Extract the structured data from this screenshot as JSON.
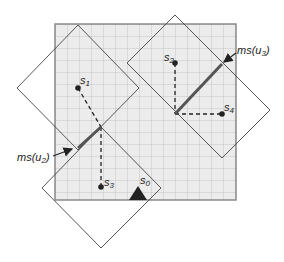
{
  "diagram": {
    "grid": {
      "x": 55,
      "y": 24,
      "width": 181,
      "height": 176,
      "cell": 12,
      "fill": "#ececec",
      "line": "#bdbdbd",
      "border": "#8a8a8a"
    },
    "points": [
      {
        "id": "s1",
        "label": "s",
        "sub": "1",
        "x": 78,
        "y": 88
      },
      {
        "id": "s2",
        "label": "s",
        "sub": "2",
        "x": 175,
        "y": 63
      },
      {
        "id": "s3",
        "label": "s",
        "sub": "3",
        "x": 101,
        "y": 187
      },
      {
        "id": "s4",
        "label": "s",
        "sub": "4",
        "x": 222,
        "y": 114
      }
    ],
    "robot": {
      "id": "s0",
      "label": "s",
      "sub": "0",
      "x": 138,
      "y": 200,
      "color": "#222222"
    },
    "labels": {
      "ms_u3": {
        "prefix": "ms(u",
        "sub": "3",
        "suffix": ")"
      },
      "ms_u2": {
        "prefix": "ms(u",
        "sub": "2",
        "suffix": ")"
      }
    },
    "segments": {
      "ms_u2": {
        "x1": 55,
        "y1": 157,
        "x2": 101,
        "y2": 127,
        "color": "#555555"
      },
      "ms_u3": {
        "x1": 175,
        "y1": 114,
        "x2": 222,
        "y2": 64,
        "color": "#555555"
      }
    }
  }
}
